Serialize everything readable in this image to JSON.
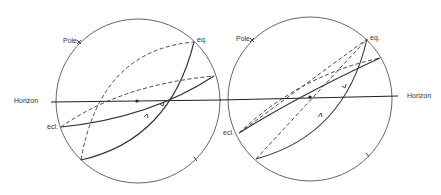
{
  "diagram": {
    "type": "celestial-sphere-comparison",
    "panels": [
      {
        "id": "left",
        "labels": {
          "pole": "Pole",
          "equator": "eq.",
          "ecliptic": "ecl.",
          "horizon": "Horizon"
        }
      },
      {
        "id": "right",
        "labels": {
          "pole": "Pole",
          "equator": "eq.",
          "ecliptic": "ecl.",
          "horizon": "Horizon"
        }
      }
    ],
    "colors": {
      "line": "#333333",
      "circle": "#555555",
      "background": "#ffffff"
    }
  }
}
